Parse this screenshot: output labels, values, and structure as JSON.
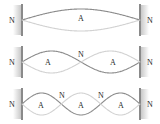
{
  "figure": {
    "width": 160,
    "height": 124,
    "background_color": "#ffffff",
    "colors": {
      "wave_dark": "#8c8c8c",
      "wave_light": "#d2d2d2",
      "wall_bar": "#8a8a8a",
      "wall_shadow": "#cfcfcf",
      "label_text": "#2a2a2a"
    },
    "wall_left_x": 22,
    "wall_right_x": 140,
    "labels": {
      "node": "N",
      "antinode": "A"
    },
    "rows": [
      {
        "name": "first-harmonic",
        "harmonic_number": 1,
        "loops": 1,
        "top": 0,
        "amplitude": 11,
        "node_labels": [
          {
            "text": "N",
            "x": 12,
            "y": 21
          },
          {
            "text": "N",
            "x": 150,
            "y": 21
          }
        ],
        "antinode_labels": [
          {
            "text": "A",
            "x": 81,
            "y": 19
          }
        ]
      },
      {
        "name": "second-harmonic",
        "harmonic_number": 2,
        "loops": 2,
        "top": 42,
        "amplitude": 11,
        "node_labels": [
          {
            "text": "N",
            "x": 12,
            "y": 21
          },
          {
            "text": "N",
            "x": 81,
            "y": 13
          },
          {
            "text": "N",
            "x": 150,
            "y": 21
          }
        ],
        "antinode_labels": [
          {
            "text": "A",
            "x": 48,
            "y": 21
          },
          {
            "text": "A",
            "x": 113,
            "y": 21
          }
        ]
      },
      {
        "name": "third-harmonic",
        "harmonic_number": 3,
        "loops": 3,
        "top": 84,
        "amplitude": 11,
        "node_labels": [
          {
            "text": "N",
            "x": 12,
            "y": 21
          },
          {
            "text": "N",
            "x": 62,
            "y": 12
          },
          {
            "text": "N",
            "x": 101,
            "y": 12
          },
          {
            "text": "N",
            "x": 150,
            "y": 21
          }
        ],
        "antinode_labels": [
          {
            "text": "A",
            "x": 41,
            "y": 22
          },
          {
            "text": "A",
            "x": 81,
            "y": 22
          },
          {
            "text": "A",
            "x": 121,
            "y": 22
          }
        ]
      }
    ]
  }
}
